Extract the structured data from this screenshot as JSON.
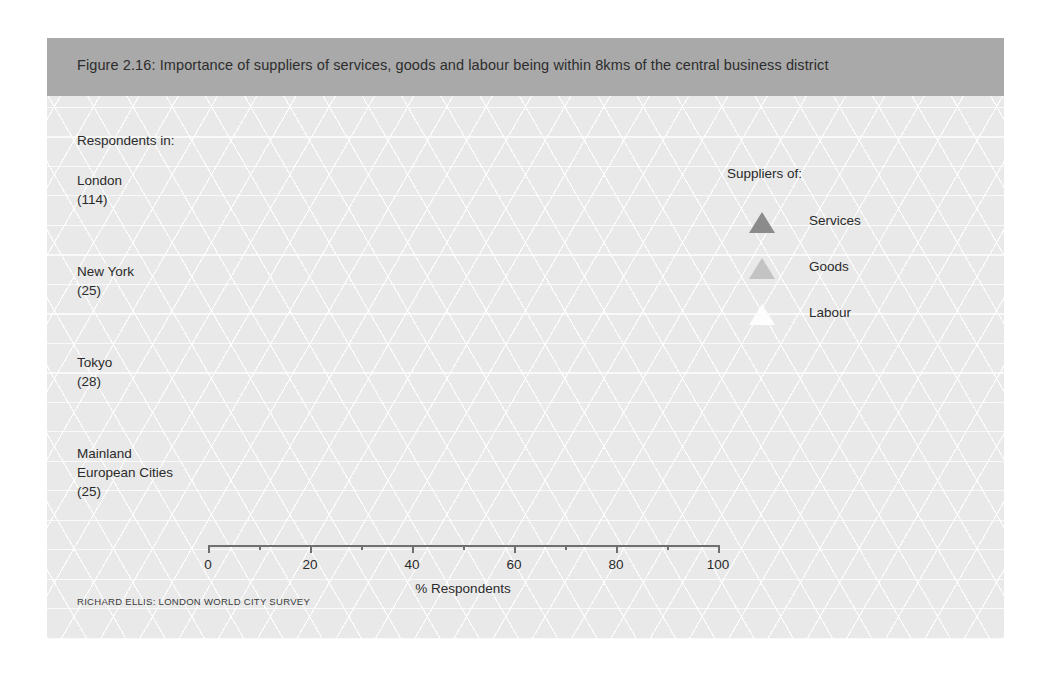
{
  "figure": {
    "title": "Figure 2.16: Importance of suppliers of services, goods and labour being within 8kms of the central business district",
    "respondents_heading": "Respondents in:",
    "source_note": "RICHARD ELLIS: LONDON WORLD CITY SURVEY",
    "legend_title": "Suppliers of:"
  },
  "colors": {
    "band": "#a9a9a9",
    "background": "#e9e9e9",
    "services": "#8b8b8b",
    "goods": "#c3c3c3",
    "labour": "#fdfdfd",
    "axis": "#6f6f6f",
    "text": "#2b2b2b"
  },
  "categories_display": [
    {
      "name": "London",
      "count": "(114)"
    },
    {
      "name": "New York",
      "count": "(25)"
    },
    {
      "name": "Tokyo",
      "count": "(28)"
    },
    {
      "name": "Mainland",
      "name2": "European Cities",
      "count": "(25)"
    }
  ],
  "chart_data": {
    "type": "bar",
    "orientation": "horizontal",
    "title": "Figure 2.16: Importance of suppliers of services, goods and labour being within 8kms of the central business district",
    "xlabel": "% Respondents",
    "ylabel": "Respondents in:",
    "xlim": [
      0,
      100
    ],
    "xticks": [
      0,
      20,
      40,
      60,
      80,
      100
    ],
    "xtick_labels": [
      "0",
      "20",
      "40",
      "60",
      "80",
      "100"
    ],
    "xminor_ticks": [
      10,
      30,
      50,
      70,
      90
    ],
    "grid": false,
    "legend_position": "right",
    "legend_title": "Suppliers of:",
    "categories": [
      "London (114)",
      "New York (25)",
      "Tokyo (28)",
      "Mainland European Cities (25)"
    ],
    "series": [
      {
        "name": "Services",
        "color": "#8b8b8b",
        "values": [
          52,
          31,
          85,
          52
        ]
      },
      {
        "name": "Goods",
        "color": "#c3c3c3",
        "values": [
          16,
          28,
          37,
          32
        ]
      },
      {
        "name": "Labour",
        "color": "#fdfdfd",
        "values": [
          8,
          18,
          47,
          31
        ]
      }
    ]
  }
}
